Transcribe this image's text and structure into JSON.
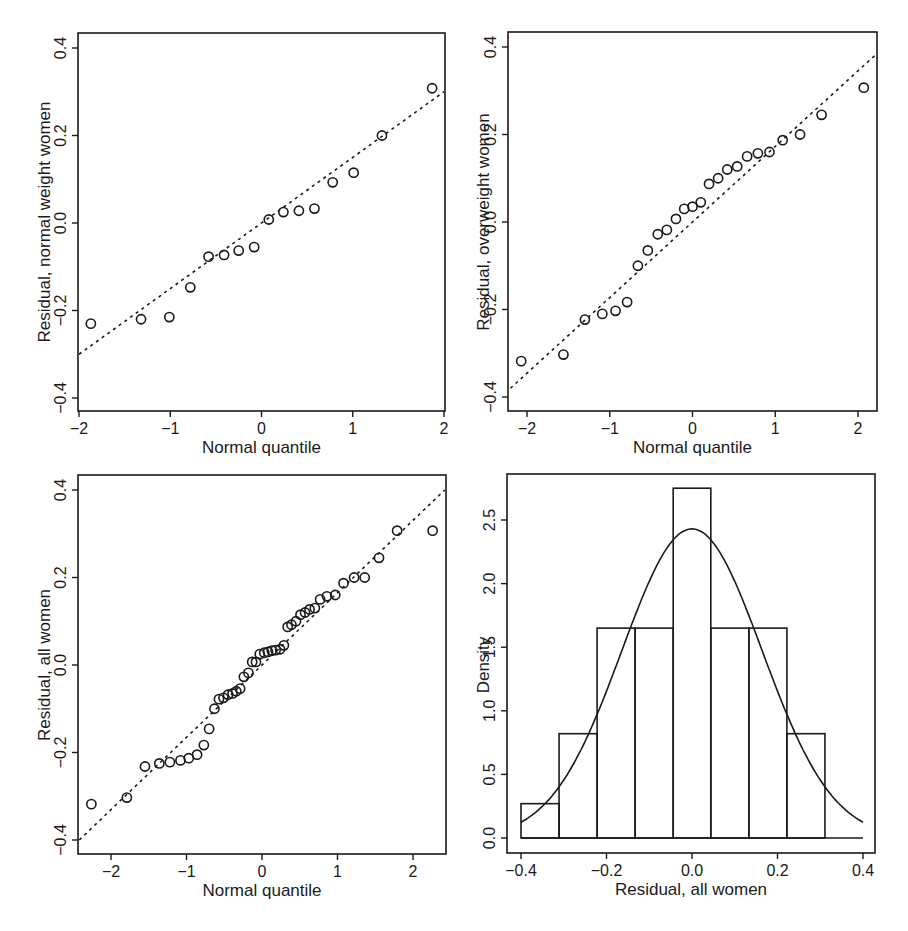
{
  "figure": {
    "panels": [
      {
        "id": "qq-normal",
        "xlabel": "Normal quantile",
        "ylabel": "Residual, normal weight women"
      },
      {
        "id": "qq-overweight",
        "xlabel": "Normal quantile",
        "ylabel": "Residual, overweight women"
      },
      {
        "id": "qq-all",
        "xlabel": "Normal quantile",
        "ylabel": "Residual, all women"
      },
      {
        "id": "hist-all",
        "xlabel": "Residual, all women",
        "ylabel": "Density"
      }
    ]
  },
  "chart_data": [
    {
      "type": "scatter",
      "title": "",
      "xlabel": "Normal quantile",
      "ylabel": "Residual, normal weight women",
      "xlim": [
        -2,
        2
      ],
      "ylim": [
        -0.42,
        0.44
      ],
      "xticks": [
        "-2",
        "-1",
        "0",
        "1",
        "2"
      ],
      "yticks": [
        "-0.4",
        "-0.2",
        "0.0",
        "0.2",
        "0.4"
      ],
      "grid": false,
      "reference_line": {
        "style": "dashed",
        "x": [
          -2,
          2
        ],
        "y": [
          -0.3,
          0.3
        ]
      },
      "points": {
        "x": [
          -1.87,
          -1.32,
          -1.01,
          -0.78,
          -0.58,
          -0.41,
          -0.25,
          -0.08,
          0.08,
          0.24,
          0.41,
          0.58,
          0.78,
          1.01,
          1.32,
          1.87
        ],
        "y": [
          -0.23,
          -0.22,
          -0.215,
          -0.147,
          -0.077,
          -0.073,
          -0.063,
          -0.055,
          0.008,
          0.025,
          0.028,
          0.033,
          0.093,
          0.115,
          0.2,
          0.308
        ]
      }
    },
    {
      "type": "scatter",
      "title": "",
      "xlabel": "Normal quantile",
      "ylabel": "Residual, overweight women",
      "xlim": [
        -2.2,
        2.2
      ],
      "ylim": [
        -0.43,
        0.43
      ],
      "xticks": [
        "-2",
        "-1",
        "0",
        "1",
        "2"
      ],
      "yticks": [
        "-0.4",
        "-0.2",
        "0.0",
        "0.2",
        "0.4"
      ],
      "grid": false,
      "reference_line": {
        "style": "dashed",
        "x": [
          -2.2,
          2.2
        ],
        "y": [
          -0.38,
          0.38
        ]
      },
      "points": {
        "x": [
          -2.07,
          -1.56,
          -1.3,
          -1.09,
          -0.93,
          -0.79,
          -0.66,
          -0.54,
          -0.42,
          -0.31,
          -0.2,
          -0.1,
          0,
          0.1,
          0.2,
          0.31,
          0.42,
          0.54,
          0.66,
          0.79,
          0.93,
          1.09,
          1.3,
          1.56,
          2.07
        ],
        "y": [
          -0.318,
          -0.303,
          -0.223,
          -0.21,
          -0.203,
          -0.183,
          -0.1,
          -0.065,
          -0.028,
          -0.018,
          0.007,
          0.03,
          0.035,
          0.045,
          0.087,
          0.1,
          0.12,
          0.127,
          0.15,
          0.157,
          0.16,
          0.187,
          0.2,
          0.245,
          0.307
        ]
      }
    },
    {
      "type": "scatter",
      "title": "",
      "xlabel": "Normal quantile",
      "ylabel": "Residual, all women",
      "xlim": [
        -2.42,
        2.42
      ],
      "ylim": [
        -0.43,
        0.43
      ],
      "xticks": [
        "-2",
        "-1",
        "0",
        "1",
        "2"
      ],
      "yticks": [
        "-0.4",
        "-0.2",
        "0.0",
        "0.2",
        "0.4"
      ],
      "grid": false,
      "reference_line": {
        "style": "dashed",
        "x": [
          -2.42,
          2.42
        ],
        "y": [
          -0.4,
          0.4
        ]
      },
      "points": {
        "x": [
          -2.26,
          -1.79,
          -1.55,
          -1.36,
          -1.22,
          -1.08,
          -0.97,
          -0.86,
          -0.77,
          -0.7,
          -0.63,
          -0.57,
          -0.51,
          -0.45,
          -0.39,
          -0.34,
          -0.29,
          -0.24,
          -0.18,
          -0.13,
          -0.08,
          -0.03,
          0.03,
          0.08,
          0.13,
          0.18,
          0.24,
          0.29,
          0.34,
          0.39,
          0.45,
          0.51,
          0.57,
          0.63,
          0.7,
          0.77,
          0.86,
          0.97,
          1.08,
          1.22,
          1.36,
          1.55,
          1.79,
          2.26
        ],
        "y": [
          -0.318,
          -0.303,
          -0.232,
          -0.225,
          -0.222,
          -0.218,
          -0.213,
          -0.205,
          -0.183,
          -0.146,
          -0.1,
          -0.078,
          -0.075,
          -0.068,
          -0.065,
          -0.06,
          -0.054,
          -0.027,
          -0.018,
          0.007,
          0.007,
          0.025,
          0.028,
          0.03,
          0.033,
          0.034,
          0.036,
          0.045,
          0.087,
          0.092,
          0.1,
          0.115,
          0.12,
          0.127,
          0.13,
          0.15,
          0.157,
          0.16,
          0.187,
          0.2,
          0.2,
          0.245,
          0.307,
          0.307
        ]
      }
    },
    {
      "type": "bar",
      "subtype": "histogram",
      "title": "",
      "xlabel": "Residual, all women",
      "ylabel": "Density",
      "xlim": [
        -0.43,
        0.43
      ],
      "ylim": [
        -0.1,
        2.9
      ],
      "xticks": [
        "-0.4",
        "-0.2",
        "0.0",
        "0.2",
        "0.4"
      ],
      "yticks": [
        "0.0",
        "0.5",
        "1.0",
        "1.5",
        "2.0",
        "2.5"
      ],
      "grid": false,
      "bin_edges": [
        -0.4,
        -0.311,
        -0.222,
        -0.133,
        -0.044,
        0.044,
        0.133,
        0.222,
        0.311
      ],
      "categories": [
        "[-0.400,-0.311)",
        "[-0.311,-0.222)",
        "[-0.222,-0.133)",
        "[-0.133,-0.044)",
        "[-0.044,0.044)",
        "[0.044,0.133)",
        "[0.133,0.222)",
        "[0.222,0.311)"
      ],
      "values": [
        0.27,
        0.82,
        1.65,
        1.65,
        2.75,
        1.65,
        1.65,
        0.82
      ],
      "overlay": {
        "type": "normal_density",
        "mean": 0.0,
        "sd": 0.164,
        "peak": 2.43,
        "x_range": [
          -0.4,
          0.4
        ]
      }
    }
  ]
}
